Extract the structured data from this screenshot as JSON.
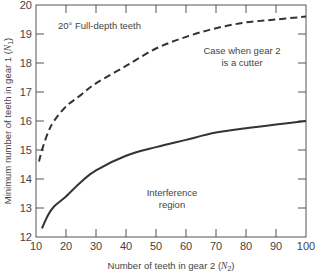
{
  "chart_data": {
    "type": "line",
    "title": "",
    "xlabel": "Number of teeth in gear 2 (N2)",
    "ylabel": "Minimum number of teeth in gear 1 (N1)",
    "xlim": [
      10,
      100
    ],
    "ylim": [
      12,
      20
    ],
    "xticks": [
      10,
      20,
      30,
      40,
      50,
      60,
      70,
      80,
      90,
      100
    ],
    "yticks": [
      12,
      13,
      14,
      15,
      16,
      17,
      18,
      19,
      20
    ],
    "grid": false,
    "legend": null,
    "series": [
      {
        "name": "Case when gear 2 is a cutter",
        "style": "dashed",
        "x": [
          11,
          12,
          14,
          16,
          20,
          25,
          30,
          40,
          50,
          60,
          70,
          80,
          90,
          100
        ],
        "y": [
          14.6,
          15.0,
          15.6,
          16.0,
          16.5,
          16.9,
          17.3,
          17.9,
          18.5,
          18.9,
          19.2,
          19.4,
          19.5,
          19.6
        ]
      },
      {
        "name": "Interference region boundary",
        "style": "solid",
        "x": [
          12,
          14,
          16,
          20,
          25,
          30,
          40,
          50,
          60,
          70,
          80,
          90,
          100
        ],
        "y": [
          12.3,
          12.75,
          13.05,
          13.4,
          13.9,
          14.3,
          14.8,
          15.1,
          15.35,
          15.6,
          15.75,
          15.88,
          16.0
        ]
      }
    ],
    "annotations": [
      {
        "text": "20° Full-depth teeth",
        "x": 30,
        "y": 19.55
      },
      {
        "text_lines": [
          "Case when gear 2",
          "is a cutter"
        ],
        "x": 77,
        "y": 18.6
      },
      {
        "text_lines": [
          "Interference",
          "region"
        ],
        "x": 58,
        "y": 13.6
      }
    ]
  },
  "labels": {
    "title_annotation": "20° Full-depth teeth",
    "cutter_line1": "Case when gear 2",
    "cutter_line2": "is a cutter",
    "interference_line1": "Interference",
    "interference_line2": "region",
    "xlabel_main": "Number of teeth in gear 2 (",
    "xlabel_var": "N",
    "xlabel_sub": "2",
    "xlabel_end": ")",
    "ylabel_main": "Minimum number of teeth in gear 1 (",
    "ylabel_var": "N",
    "ylabel_sub": "1",
    "ylabel_end": ")"
  }
}
